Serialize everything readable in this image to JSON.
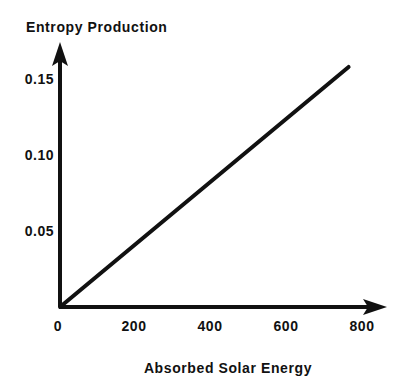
{
  "chart_data": {
    "type": "line",
    "title": "",
    "xlabel": "Absorbed Solar Energy",
    "ylabel": "Entropy Production",
    "xlim": [
      0,
      800
    ],
    "ylim": [
      0,
      0.16
    ],
    "grid": false,
    "legend": "none",
    "x_ticks": [
      "0",
      "200",
      "400",
      "600",
      "800"
    ],
    "x_tick_values": [
      0,
      200,
      400,
      600,
      800
    ],
    "y_ticks": [
      "0.05",
      "0.10",
      "0.15"
    ],
    "y_tick_values": [
      0.05,
      0.1,
      0.15
    ],
    "series": [
      {
        "name": "Entropy Production",
        "color": "#111111",
        "x": [
          0,
          740
        ],
        "values": [
          0.0,
          0.153
        ],
        "points": [
          {
            "x": 0,
            "y": 0.0
          },
          {
            "x": 100,
            "y": 0.0207
          },
          {
            "x": 200,
            "y": 0.0414
          },
          {
            "x": 300,
            "y": 0.062
          },
          {
            "x": 400,
            "y": 0.0827
          },
          {
            "x": 500,
            "y": 0.1034
          },
          {
            "x": 600,
            "y": 0.1241
          },
          {
            "x": 700,
            "y": 0.1447
          },
          {
            "x": 740,
            "y": 0.153
          }
        ]
      }
    ],
    "annotations": []
  },
  "axes": {
    "y_title": "Entropy Production",
    "x_title": "Absorbed Solar Energy",
    "y_tick_labels": [
      "0.15",
      "0.10",
      "0.05"
    ],
    "x_tick_labels": [
      "0",
      "200",
      "400",
      "600",
      "800"
    ],
    "axis_color": "#111111"
  },
  "colors": {
    "background": "#ffffff",
    "ink": "#111111",
    "line": "#111111"
  }
}
